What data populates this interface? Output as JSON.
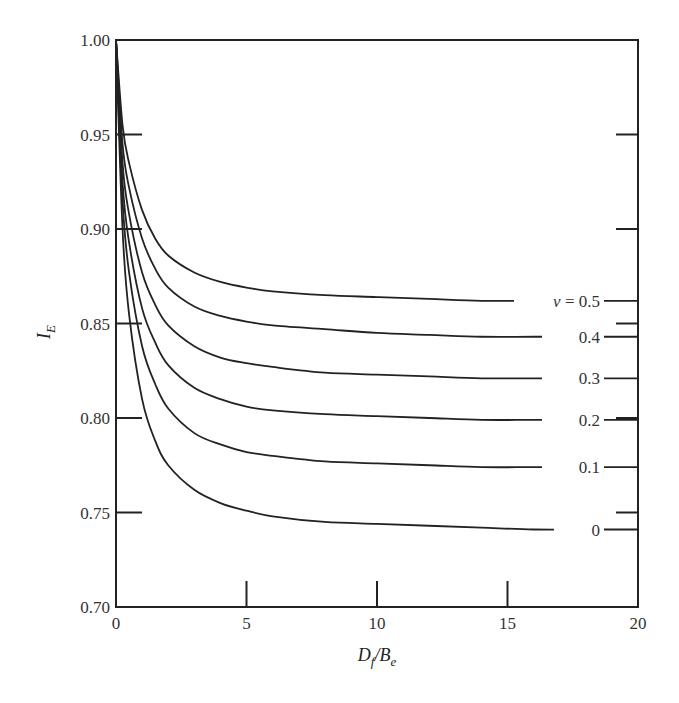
{
  "chart_data": {
    "type": "line",
    "title": "",
    "xlabel": "D_f/B_e",
    "ylabel": "I_E",
    "xlim": [
      0,
      20
    ],
    "ylim": [
      0.7,
      1.0
    ],
    "grid": false,
    "legend_position": "inline labels at right end of curves",
    "x_ticks": [
      0,
      5,
      10,
      15,
      20
    ],
    "x_tick_labels": [
      "0",
      "5",
      "10",
      "15",
      "20"
    ],
    "y_ticks": [
      0.7,
      0.75,
      0.8,
      0.85,
      0.9,
      0.95,
      1.0
    ],
    "y_tick_labels": [
      "0.70",
      "0.75",
      "0.80",
      "0.85",
      "0.90",
      "0.95",
      "1.00"
    ],
    "x": [
      0,
      0.25,
      0.5,
      1,
      1.5,
      2,
      3,
      4,
      5,
      6,
      8,
      10,
      12,
      14,
      16,
      18,
      20
    ],
    "series": [
      {
        "name": "ν = 0.5",
        "label": "ν = 0.5",
        "values": [
          1.0,
          0.955,
          0.935,
          0.91,
          0.895,
          0.886,
          0.877,
          0.872,
          0.869,
          0.867,
          0.865,
          0.864,
          0.863,
          0.862,
          0.862,
          0.862,
          0.862
        ]
      },
      {
        "name": "ν = 0.4",
        "label": "0.4",
        "values": [
          1.0,
          0.945,
          0.922,
          0.895,
          0.879,
          0.869,
          0.859,
          0.854,
          0.851,
          0.849,
          0.847,
          0.845,
          0.844,
          0.843,
          0.843,
          0.843,
          0.843
        ]
      },
      {
        "name": "ν = 0.3",
        "label": "0.3",
        "values": [
          1.0,
          0.935,
          0.908,
          0.877,
          0.86,
          0.849,
          0.838,
          0.832,
          0.829,
          0.827,
          0.824,
          0.823,
          0.822,
          0.821,
          0.821,
          0.821,
          0.821
        ]
      },
      {
        "name": "ν = 0.2",
        "label": "0.2",
        "values": [
          1.0,
          0.925,
          0.893,
          0.858,
          0.84,
          0.828,
          0.816,
          0.81,
          0.806,
          0.804,
          0.802,
          0.801,
          0.8,
          0.799,
          0.799,
          0.799,
          0.799
        ]
      },
      {
        "name": "ν = 0.1",
        "label": "0.1",
        "values": [
          1.0,
          0.915,
          0.877,
          0.838,
          0.818,
          0.805,
          0.792,
          0.786,
          0.782,
          0.78,
          0.777,
          0.776,
          0.775,
          0.774,
          0.774,
          0.774,
          0.774
        ]
      },
      {
        "name": "ν = 0",
        "label": "0",
        "values": [
          1.0,
          0.9,
          0.855,
          0.81,
          0.788,
          0.775,
          0.762,
          0.755,
          0.751,
          0.748,
          0.745,
          0.744,
          0.743,
          0.742,
          0.741,
          0.741,
          0.741
        ]
      }
    ]
  },
  "axes": {
    "xlabel_main": "D",
    "xlabel_sub1": "f",
    "xlabel_slash": "/B",
    "xlabel_sub2": "e",
    "ylabel_main": "I",
    "ylabel_sub": "E"
  }
}
